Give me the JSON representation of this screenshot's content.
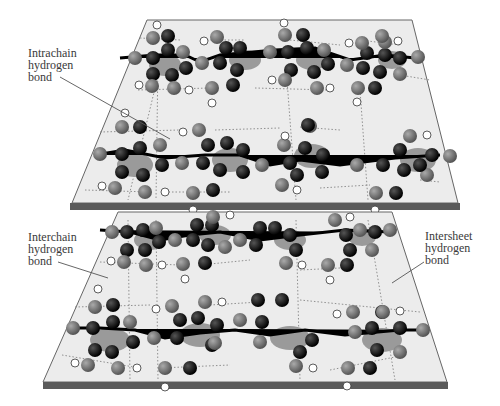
{
  "figure": {
    "type": "beta-sheet hydrogen bonding diagram",
    "labels": {
      "intrachain": [
        "Intrachain",
        "hydrogen",
        "bond"
      ],
      "interchain": [
        "Interchain",
        "hydrogen",
        "bond"
      ],
      "intersheet": [
        "Intersheet",
        "hydrogen",
        "bond"
      ]
    },
    "colors": {
      "plane": "#ececec",
      "plane_edge": "#5a5a5a",
      "carbon": "#000000",
      "heteroatom": "#6e6e6e",
      "hydrogen": "#ffffff",
      "ring_fill": "#9a9a9a"
    },
    "sheets": 2
  }
}
